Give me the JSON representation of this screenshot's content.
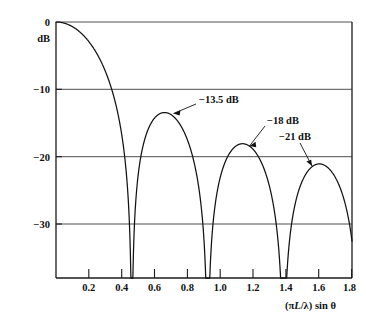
{
  "chart_data": {
    "type": "line",
    "title": "",
    "subtitle": "",
    "xlabel": "(πL/λ) sin θ",
    "ylabel": "dB",
    "xlim": [
      0.0,
      1.9
    ],
    "ylim": [
      -37.5,
      0
    ],
    "grid": true,
    "legend_position": "none",
    "x_ticks": [
      "0.2",
      "0.4",
      "0.6",
      "0.8",
      "1.0",
      "1.2",
      "1.4",
      "1.6",
      "1.8"
    ],
    "x_tick_values": [
      0.2,
      0.4,
      0.6,
      0.8,
      1.0,
      1.2,
      1.4,
      1.6,
      1.8
    ],
    "y_ticks": [
      "0",
      "−10",
      "−20",
      "−30"
    ],
    "y_tick_values": [
      0,
      -10,
      -20,
      -30
    ],
    "function": "20*log10(|sin(pi*u/0.4867)/(pi*u/0.4867)|)",
    "null_positions": [
      0.487,
      0.973,
      1.46
    ],
    "sidelobe_peaks": [
      {
        "x": 0.72,
        "y": -13.5,
        "label": "−13.5 dB"
      },
      {
        "x": 1.21,
        "y": -18.0,
        "label": "−18 dB"
      },
      {
        "x": 1.7,
        "y": -21.0,
        "label": "−21 dB"
      }
    ],
    "annotations": [
      {
        "text": "−13.5 dB",
        "points_to_x": 0.72,
        "points_to_y": -13.5
      },
      {
        "text": "−18 dB",
        "points_to_x": 1.21,
        "points_to_y": -18.0
      },
      {
        "text": "−21 dB",
        "points_to_x": 1.7,
        "points_to_y": -21.0
      }
    ],
    "main_lobe_peak": {
      "x": 0.0,
      "y": 0.0
    }
  },
  "axis_labels": {
    "x_title_prefix": "(",
    "x_title_pi": "π",
    "x_title_L": "L",
    "x_title_slash": "/",
    "x_title_lambda": "λ",
    "x_title_suffix": ") sin ",
    "x_title_theta": "θ",
    "y_unit": "dB",
    "y_zero": "0",
    "y_minus10": "−10",
    "y_minus20": "−20",
    "y_minus30": "−30"
  },
  "x_tick_labels": {
    "t1": "0.2",
    "t2": "0.4",
    "t3": "0.6",
    "t4": "0.8",
    "t5": "1.0",
    "t6": "1.2",
    "t7": "1.4",
    "t8": "1.6",
    "t9": "1.8"
  },
  "annotation_labels": {
    "a1": "−13.5 dB",
    "a2": "−18 dB",
    "a3": "−21 dB"
  },
  "colors": {
    "curve": "#121212",
    "axis": "#1b1b1b",
    "grid": "#3a3a3a",
    "background": "#ffffff",
    "text": "#111111"
  }
}
